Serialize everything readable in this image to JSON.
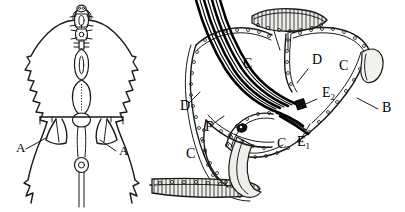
{
  "figure": {
    "type": "scientific-line-drawing",
    "background_color": "#ffffff",
    "ink_color": "#1a1a1a",
    "panels": [
      {
        "id": "left-panel",
        "name": "dorsal-habitus-outline",
        "description": "Bilaterally symmetric outline of anterior body region with median axial structure and paired lateral flaps",
        "labels": [
          {
            "id": "left-A",
            "text": "A",
            "x": 16,
            "y": 152
          },
          {
            "id": "right-A",
            "text": "A",
            "x": 119,
            "y": 155
          }
        ]
      },
      {
        "id": "right-panel",
        "name": "internal-anatomy-section",
        "description": "Detailed sectional drawing of internal chambers bounded by beaded membranes, traversed by a striped fibre bundle",
        "labels": [
          {
            "id": "C-upper-left",
            "text": "C",
            "x": 243,
            "y": 68
          },
          {
            "id": "C-upper-right",
            "text": "C",
            "x": 339,
            "y": 70
          },
          {
            "id": "C-lower-left",
            "text": "C",
            "x": 186,
            "y": 158
          },
          {
            "id": "C-lower-mid",
            "text": "C",
            "x": 277,
            "y": 148
          },
          {
            "id": "D-upper",
            "text": "D",
            "x": 312,
            "y": 64
          },
          {
            "id": "D-left",
            "text": "D",
            "x": 180,
            "y": 110
          },
          {
            "id": "B-right",
            "text": "B",
            "x": 382,
            "y": 112
          },
          {
            "id": "F-left",
            "text": "F",
            "x": 205,
            "y": 131
          },
          {
            "id": "E1",
            "text": "E",
            "sub": "1",
            "x": 297,
            "y": 146
          },
          {
            "id": "E2",
            "text": "E",
            "sub": "2",
            "x": 322,
            "y": 97
          }
        ]
      }
    ]
  }
}
